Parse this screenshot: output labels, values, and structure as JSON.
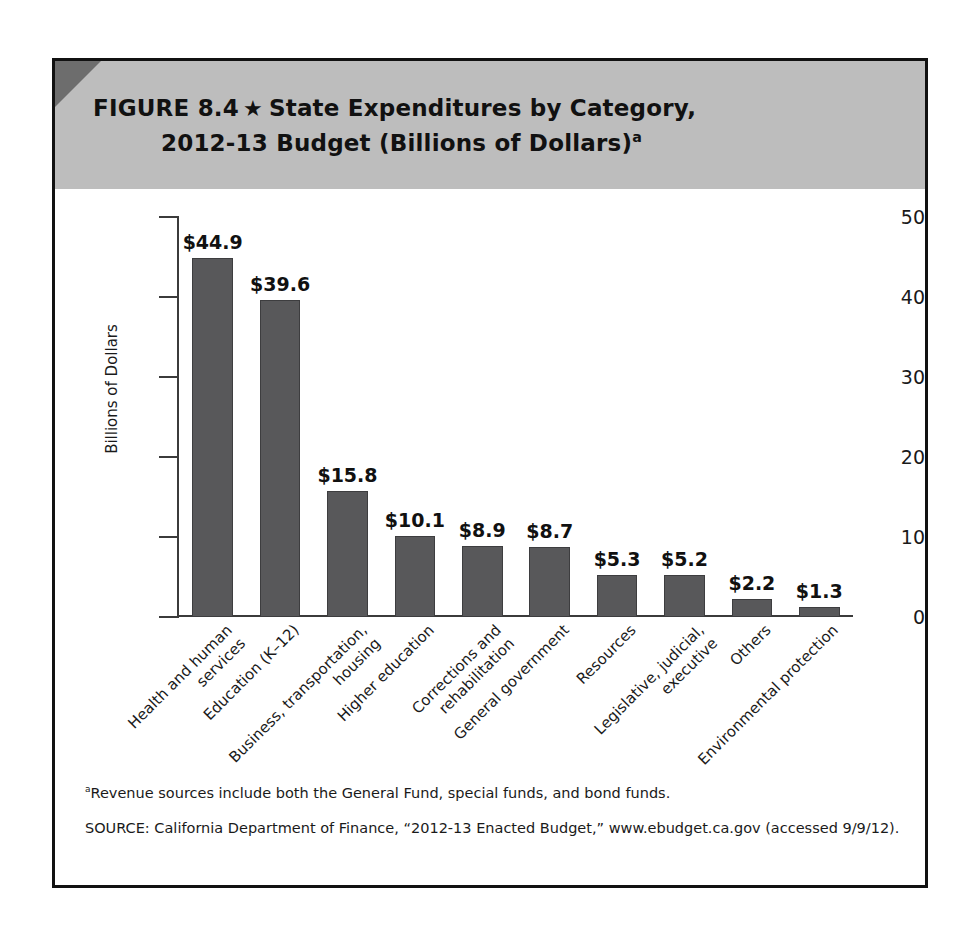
{
  "figure": {
    "label": "FIGURE 8.4",
    "star_icon": "★",
    "title_line_1": "State Expenditures by Category,",
    "title_line_2": "2012-13 Budget (Billions of Dollars)",
    "title_superscript": "a"
  },
  "notes": {
    "footnote_marker": "a",
    "footnote": "Revenue sources include both the General Fund, special funds, and bond funds.",
    "source": "SOURCE: California Department of Finance, “2012-13 Enacted Budget,” www.ebudget.ca.gov (accessed 9/9/12)."
  },
  "colors": {
    "bar_fill": "#58585a",
    "header_band": "#bdbdbd",
    "header_corner": "#6d6d6d",
    "frame": "#111111",
    "axis": "#3b3b3b"
  },
  "chart_data": {
    "type": "bar",
    "title": "State Expenditures by Category, 2012-13 Budget (Billions of Dollars)",
    "xlabel": "",
    "ylabel": "Billions of Dollars",
    "ylim": [
      0,
      50
    ],
    "yticks": [
      0,
      10,
      20,
      30,
      40,
      50
    ],
    "ytick_labels": [
      "0",
      "10",
      "20",
      "30",
      "40",
      "50"
    ],
    "grid": false,
    "legend": false,
    "categories": [
      "Health and human services",
      "Education (K–12)",
      "Business, transportation, housing",
      "Higher education",
      "Corrections and rehabilitation",
      "General government",
      "Resources",
      "Legislative, judicial, executive",
      "Others",
      "Environmental protection"
    ],
    "category_lines": [
      [
        "Health and human",
        "services"
      ],
      [
        "Education (K–12)"
      ],
      [
        "Business, transportation,",
        "housing"
      ],
      [
        "Higher education"
      ],
      [
        "Corrections and",
        "rehabilitation"
      ],
      [
        "General government"
      ],
      [
        "Resources"
      ],
      [
        "Legislative, judicial,",
        "executive"
      ],
      [
        "Others"
      ],
      [
        "Environmental protection"
      ]
    ],
    "values": [
      44.9,
      39.6,
      15.8,
      10.1,
      8.9,
      8.7,
      5.3,
      5.2,
      2.2,
      1.3
    ],
    "value_labels": [
      "$44.9",
      "$39.6",
      "$15.8",
      "$10.1",
      "$8.9",
      "$8.7",
      "$5.3",
      "$5.2",
      "$2.2",
      "$1.3"
    ]
  }
}
